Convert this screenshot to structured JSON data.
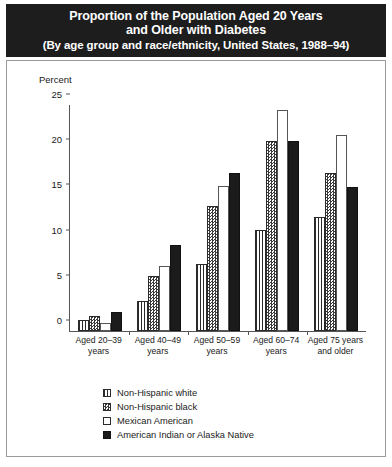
{
  "title": {
    "line1": "Proportion of the Population Aged 20 Years",
    "line2": "and Older with Diabetes",
    "line3": "(By age group and race/ethnicity, United States, 1988–94)"
  },
  "axis_unit_label": "Percent",
  "chart_data": {
    "type": "bar",
    "title": "Proportion of the Population Aged 20 Years and Older with Diabetes",
    "subtitle": "(By age group and race/ethnicity, United States, 1988–94)",
    "xlabel": "",
    "ylabel": "Percent",
    "ylim": [
      0,
      25
    ],
    "yticks": [
      0,
      5,
      10,
      15,
      20,
      25
    ],
    "grid": false,
    "legend_position": "bottom",
    "categories": [
      "Aged 20–39 years",
      "Aged 40–49 years",
      "Aged 50–59 years",
      "Aged 60–74 years",
      "Aged 75 years and older"
    ],
    "category_lines": [
      [
        "Aged 20–39",
        "years"
      ],
      [
        "Aged 40–49",
        "years"
      ],
      [
        "Aged 50–59",
        "years"
      ],
      [
        "Aged 60–74",
        "years"
      ],
      [
        "Aged 75 years",
        "and older"
      ]
    ],
    "series": [
      {
        "name": "Non-Hispanic white",
        "pattern": "vstripe",
        "values": [
          1.2,
          3.3,
          7.4,
          11.2,
          12.6
        ]
      },
      {
        "name": "Non-Hispanic black",
        "pattern": "checker",
        "values": [
          1.7,
          6.1,
          13.8,
          21.0,
          17.5
        ]
      },
      {
        "name": "Mexican American",
        "pattern": "empty",
        "values": [
          0.9,
          7.2,
          16.0,
          24.4,
          21.7
        ]
      },
      {
        "name": "American Indian or Alaska Native",
        "pattern": "solid",
        "values": [
          2.1,
          9.5,
          17.5,
          21.0,
          15.9
        ]
      }
    ]
  }
}
